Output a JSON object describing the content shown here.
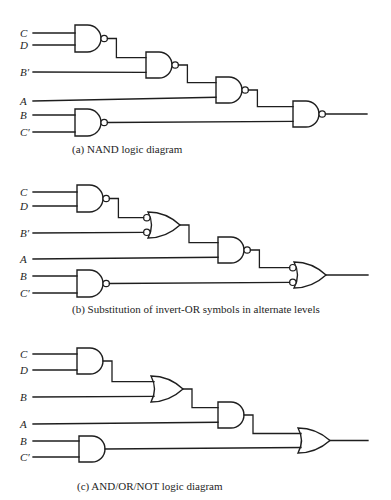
{
  "colors": {
    "ink": "#1e1e1e",
    "background": "#ffffff"
  },
  "diagrams": [
    {
      "id": "a",
      "caption": "(a)  NAND logic diagram",
      "caption_pos": [
        72,
        153
      ],
      "inputs": [
        {
          "label": "C",
          "y": 33
        },
        {
          "label": "D",
          "y": 45
        },
        {
          "label": "B′",
          "y": 72
        },
        {
          "label": "A",
          "y": 101
        },
        {
          "label": "B",
          "y": 115
        },
        {
          "label": "C′",
          "y": 132
        }
      ],
      "gates": [
        {
          "name": "nand-gate-1",
          "type": "AND",
          "x": 75,
          "top": 25,
          "bottom": 52,
          "out_bubble": true,
          "in_bubbles": false
        },
        {
          "name": "nand-gate-2",
          "type": "AND",
          "x": 146,
          "top": 52,
          "bottom": 78,
          "out_bubble": true,
          "in_bubbles": false
        },
        {
          "name": "nand-gate-3",
          "type": "AND",
          "x": 216,
          "top": 77,
          "bottom": 103,
          "out_bubble": true,
          "in_bubbles": false
        },
        {
          "name": "nand-gate-4",
          "type": "AND",
          "x": 293,
          "top": 101,
          "bottom": 127,
          "out_bubble": true,
          "in_bubbles": false
        },
        {
          "name": "nand-gate-5",
          "type": "AND",
          "x": 75,
          "top": 109,
          "bottom": 136,
          "out_bubble": true,
          "in_bubbles": false
        }
      ],
      "output_end_x": 367
    },
    {
      "id": "b",
      "caption": "(b)  Substitution of invert-OR symbols in alternate levels",
      "caption_pos": [
        72,
        313
      ],
      "inputs": [
        {
          "label": "C",
          "y": 192
        },
        {
          "label": "D",
          "y": 206
        },
        {
          "label": "B′",
          "y": 233
        },
        {
          "label": "A",
          "y": 259
        },
        {
          "label": "B",
          "y": 276
        },
        {
          "label": "C′",
          "y": 293
        }
      ],
      "gates": [
        {
          "name": "nand-gate-1",
          "type": "AND",
          "x": 77,
          "top": 185,
          "bottom": 212,
          "out_bubble": true,
          "in_bubbles": false
        },
        {
          "name": "invert-or-gate-2",
          "type": "OR",
          "x": 148,
          "top": 212,
          "bottom": 238,
          "out_bubble": false,
          "in_bubbles": true
        },
        {
          "name": "nand-gate-3",
          "type": "AND",
          "x": 218,
          "top": 237,
          "bottom": 263,
          "out_bubble": true,
          "in_bubbles": false
        },
        {
          "name": "invert-or-gate-4",
          "type": "OR",
          "x": 294,
          "top": 262,
          "bottom": 288,
          "out_bubble": false,
          "in_bubbles": true
        },
        {
          "name": "nand-gate-5",
          "type": "AND",
          "x": 77,
          "top": 270,
          "bottom": 297,
          "out_bubble": true,
          "in_bubbles": false
        }
      ],
      "output_end_x": 368
    },
    {
      "id": "c",
      "caption": "(c)  AND/OR/NOT logic diagram",
      "caption_pos": [
        77,
        490
      ],
      "inputs": [
        {
          "label": "C",
          "y": 354
        },
        {
          "label": "D",
          "y": 370
        },
        {
          "label": "B",
          "y": 397
        },
        {
          "label": "A",
          "y": 424
        },
        {
          "label": "B",
          "y": 441
        },
        {
          "label": "C′",
          "y": 457
        }
      ],
      "gates": [
        {
          "name": "and-gate-1",
          "type": "AND",
          "x": 77,
          "top": 348,
          "bottom": 374,
          "out_bubble": false,
          "in_bubbles": false
        },
        {
          "name": "or-gate-2",
          "type": "OR",
          "x": 151,
          "top": 376,
          "bottom": 402,
          "out_bubble": false,
          "in_bubbles": false
        },
        {
          "name": "and-gate-3",
          "type": "AND",
          "x": 218,
          "top": 402,
          "bottom": 428,
          "out_bubble": false,
          "in_bubbles": false
        },
        {
          "name": "or-gate-4",
          "type": "OR",
          "x": 298,
          "top": 428,
          "bottom": 453,
          "out_bubble": false,
          "in_bubbles": false
        },
        {
          "name": "and-gate-5",
          "type": "AND",
          "x": 79,
          "top": 436,
          "bottom": 462,
          "out_bubble": false,
          "in_bubbles": false
        }
      ],
      "output_end_x": 368
    }
  ]
}
